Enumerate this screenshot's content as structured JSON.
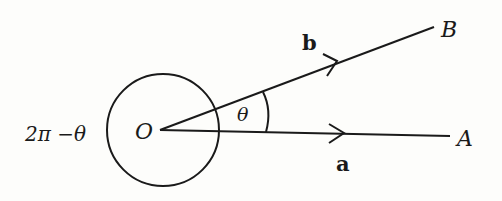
{
  "diagram": {
    "type": "vector-angle",
    "labels": {
      "origin": "O",
      "point_a": "A",
      "point_b": "B",
      "vector_a": "a",
      "vector_b": "b",
      "angle_inner": "θ",
      "angle_outer": "2π −θ"
    },
    "colors": {
      "stroke": "#1a1a1a",
      "background": "#fdfdfb"
    }
  }
}
